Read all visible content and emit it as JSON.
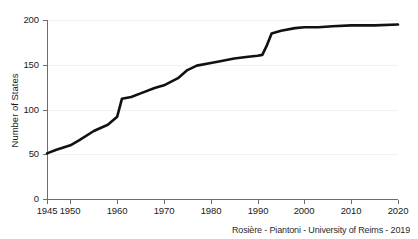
{
  "credit": "Rosière - Piantoni - University of Reims - 2019",
  "chart_data": {
    "type": "line",
    "title": "",
    "xlabel": "",
    "ylabel": "Number of States",
    "xlim": [
      1945,
      2020
    ],
    "ylim": [
      0,
      200
    ],
    "grid": true,
    "legend": null,
    "xticks": [
      1945,
      1950,
      1960,
      1970,
      1980,
      1990,
      2000,
      2010,
      2020
    ],
    "xtick_labels": [
      "1945",
      "1950",
      "1960",
      "1970",
      "1980",
      "1990",
      "2000",
      "2010",
      "2020"
    ],
    "yticks": [
      0,
      50,
      100,
      150,
      200
    ],
    "ytick_labels": [
      "0",
      "50",
      "100",
      "150",
      "200"
    ],
    "series": [
      {
        "name": "Number of States",
        "color": "#111111",
        "x": [
          1945,
          1947,
          1950,
          1952,
          1955,
          1958,
          1960,
          1961,
          1963,
          1965,
          1968,
          1970,
          1973,
          1975,
          1977,
          1980,
          1982,
          1985,
          1988,
          1990,
          1991,
          1992,
          1993,
          1995,
          1998,
          2000,
          2003,
          2006,
          2010,
          2015,
          2020
        ],
        "values": [
          51,
          55,
          60,
          66,
          76,
          83,
          92,
          112,
          114,
          118,
          124,
          127,
          135,
          144,
          149,
          152,
          154,
          157,
          159,
          160,
          161,
          172,
          185,
          188,
          191,
          192,
          192,
          193,
          194,
          194,
          195
        ]
      }
    ]
  }
}
